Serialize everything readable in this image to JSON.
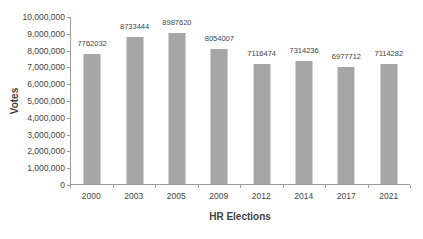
{
  "chart_data": {
    "type": "bar",
    "title": "",
    "xlabel": "HR Elections",
    "ylabel": "Votes",
    "categories": [
      "2000",
      "2003",
      "2005",
      "2009",
      "2012",
      "2014",
      "2017",
      "2021"
    ],
    "values": [
      7762032,
      8733444,
      8987620,
      8054007,
      7116474,
      7314236,
      6977712,
      7114282
    ],
    "data_labels": [
      "7762032",
      "8733444",
      "8987620",
      "8054007",
      "7116474",
      "7314236",
      "6977712",
      "7114282"
    ],
    "ylim": [
      0,
      10000000
    ],
    "ytick_step": 1000000,
    "ytick_labels": [
      "0",
      "1,000,000",
      "2,000,000",
      "3,000,000",
      "4,000,000",
      "5,000,000",
      "6,000,000",
      "7,000,000",
      "8,000,000",
      "9,000,000",
      "10,000,000"
    ],
    "grid": false,
    "legend": false,
    "bar_color": "#a6a6a6",
    "axis_color": "#9b9b9b",
    "text_color": "#3f3f3f"
  }
}
